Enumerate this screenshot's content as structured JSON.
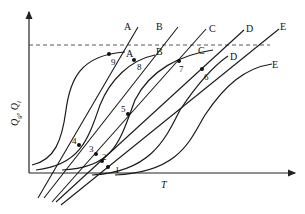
{
  "figure": {
    "x_axis_label": "T",
    "y_axis_label_main": "Q",
    "y_axis_label_full": "Q'g, Q'l",
    "y_sub_1": "g",
    "y_sub_2": "l"
  },
  "curve_labels": {
    "generation": [
      "A",
      "B",
      "C",
      "D",
      "E"
    ],
    "removal": [
      "A",
      "B",
      "C",
      "D",
      "E"
    ]
  },
  "labels": {
    "line_A": "A",
    "line_B": "B",
    "line_C": "C",
    "line_D": "D",
    "line_E": "E",
    "curve_A": "A",
    "curve_B": "B",
    "curve_C": "C",
    "curve_D": "D",
    "curve_E": "E"
  },
  "points": {
    "p1": "1",
    "p2": "2",
    "p3": "3",
    "p4": "4",
    "p5": "5",
    "p6": "6",
    "p7": "7",
    "p8": "8",
    "p9": "9"
  },
  "colors": {
    "ink": "#1a1a1a",
    "dash": "#444444",
    "background": "#ffffff"
  }
}
